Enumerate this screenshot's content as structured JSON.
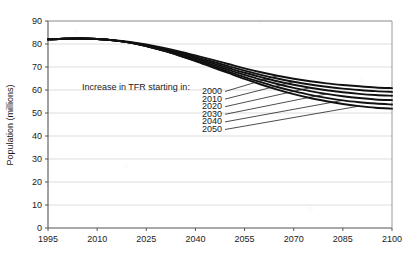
{
  "chart_data": {
    "type": "line",
    "title": "",
    "xlabel": "",
    "ylabel": "Population (millions)",
    "xlim": [
      1995,
      2100
    ],
    "ylim": [
      0,
      90
    ],
    "xticks": [
      1995,
      2010,
      2025,
      2040,
      2055,
      2070,
      2085,
      2100
    ],
    "yticks": [
      0,
      10,
      20,
      30,
      40,
      50,
      60,
      70,
      80,
      90
    ],
    "grid": "horizontal",
    "legend_position": "inside-left",
    "annotation": "Increase in TFR starting in:",
    "x": [
      1995,
      2000,
      2005,
      2010,
      2015,
      2020,
      2025,
      2030,
      2035,
      2040,
      2045,
      2050,
      2055,
      2060,
      2065,
      2070,
      2075,
      2080,
      2085,
      2090,
      2095,
      2100
    ],
    "series": [
      {
        "name": "2000",
        "label": "2000",
        "values": [
          82.0,
          82.3,
          82.4,
          82.2,
          81.7,
          80.9,
          79.8,
          78.4,
          76.8,
          75.0,
          73.2,
          71.3,
          69.4,
          67.7,
          66.2,
          64.9,
          63.8,
          62.9,
          62.2,
          61.6,
          61.1,
          60.8
        ]
      },
      {
        "name": "2010",
        "label": "2010",
        "values": [
          82.0,
          82.3,
          82.4,
          82.2,
          81.6,
          80.7,
          79.5,
          78.0,
          76.3,
          74.4,
          72.4,
          70.4,
          68.4,
          66.6,
          65.0,
          63.6,
          62.4,
          61.4,
          60.6,
          60.0,
          59.5,
          59.2
        ]
      },
      {
        "name": "2020",
        "label": "2020",
        "values": [
          82.0,
          82.3,
          82.4,
          82.2,
          81.6,
          80.6,
          79.2,
          77.6,
          75.8,
          73.8,
          71.7,
          69.6,
          67.5,
          65.6,
          63.8,
          62.3,
          61.0,
          59.9,
          59.0,
          58.3,
          57.8,
          57.5
        ]
      },
      {
        "name": "2030",
        "label": "2030",
        "values": [
          82.0,
          82.3,
          82.4,
          82.2,
          81.6,
          80.6,
          79.1,
          77.3,
          75.4,
          73.2,
          71.0,
          68.8,
          66.6,
          64.5,
          62.6,
          60.9,
          59.5,
          58.3,
          57.3,
          56.5,
          55.9,
          55.6
        ]
      },
      {
        "name": "2040",
        "label": "2040",
        "values": [
          82.0,
          82.3,
          82.4,
          82.2,
          81.6,
          80.6,
          79.1,
          77.2,
          75.1,
          72.8,
          70.4,
          68.0,
          65.6,
          63.4,
          61.3,
          59.5,
          57.9,
          56.6,
          55.5,
          54.7,
          54.1,
          53.7
        ]
      },
      {
        "name": "2050",
        "label": "2050",
        "values": [
          82.0,
          82.3,
          82.4,
          82.2,
          81.6,
          80.6,
          79.1,
          77.2,
          75.0,
          72.6,
          70.0,
          67.4,
          64.8,
          62.4,
          60.2,
          58.2,
          56.5,
          55.1,
          53.9,
          53.0,
          52.3,
          51.9
        ]
      }
    ]
  }
}
